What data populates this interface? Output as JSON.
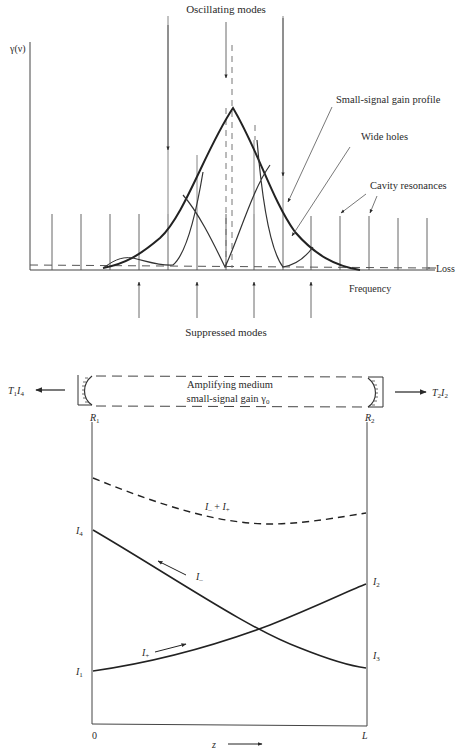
{
  "top_figure": {
    "y_axis_label": "γ(ν)",
    "x_axis_label": "Frequency",
    "loss_label": "Loss",
    "labels": {
      "oscillating_modes": "Oscillating modes",
      "small_signal_gain_profile": "Small-signal gain profile",
      "wide_holes": "Wide holes",
      "cavity_resonances": "Cavity resonances",
      "suppressed_modes": "Suppressed modes"
    },
    "cavity_resonance_x": [
      52,
      81,
      110,
      139,
      168,
      197,
      226,
      254,
      283,
      311,
      340,
      369,
      398,
      427
    ],
    "colors": {
      "ink": "#2a2a2a",
      "thin": "#555555"
    }
  },
  "bottom_figure": {
    "cavity": {
      "medium_line1": "Amplifying medium",
      "medium_line2": "small-signal gain γ",
      "medium_sub": "0",
      "mirror_left": "R",
      "mirror_left_sub": "1",
      "mirror_right": "R",
      "mirror_right_sub": "2",
      "output_left": "T",
      "output_left_sub1": "1",
      "output_left_i": "I",
      "output_left_sub2": "4",
      "output_right": "T",
      "output_right_sub1": "2",
      "output_right_i": "I",
      "output_right_sub2": "2"
    },
    "plot": {
      "x_start_label": "0",
      "x_end_label": "L",
      "z_label": "z",
      "sum_label_a": "I",
      "sum_label_sub_a": "–",
      "sum_label_plus": " + ",
      "sum_label_b": "I",
      "sum_label_sub_b": "+",
      "i_minus": "I",
      "i_minus_sub": "–",
      "i_plus": "I",
      "i_plus_sub": "+",
      "i1": "I",
      "i1_sub": "1",
      "i2": "I",
      "i2_sub": "2",
      "i3": "I",
      "i3_sub": "3",
      "i4": "I",
      "i4_sub": "4"
    }
  }
}
